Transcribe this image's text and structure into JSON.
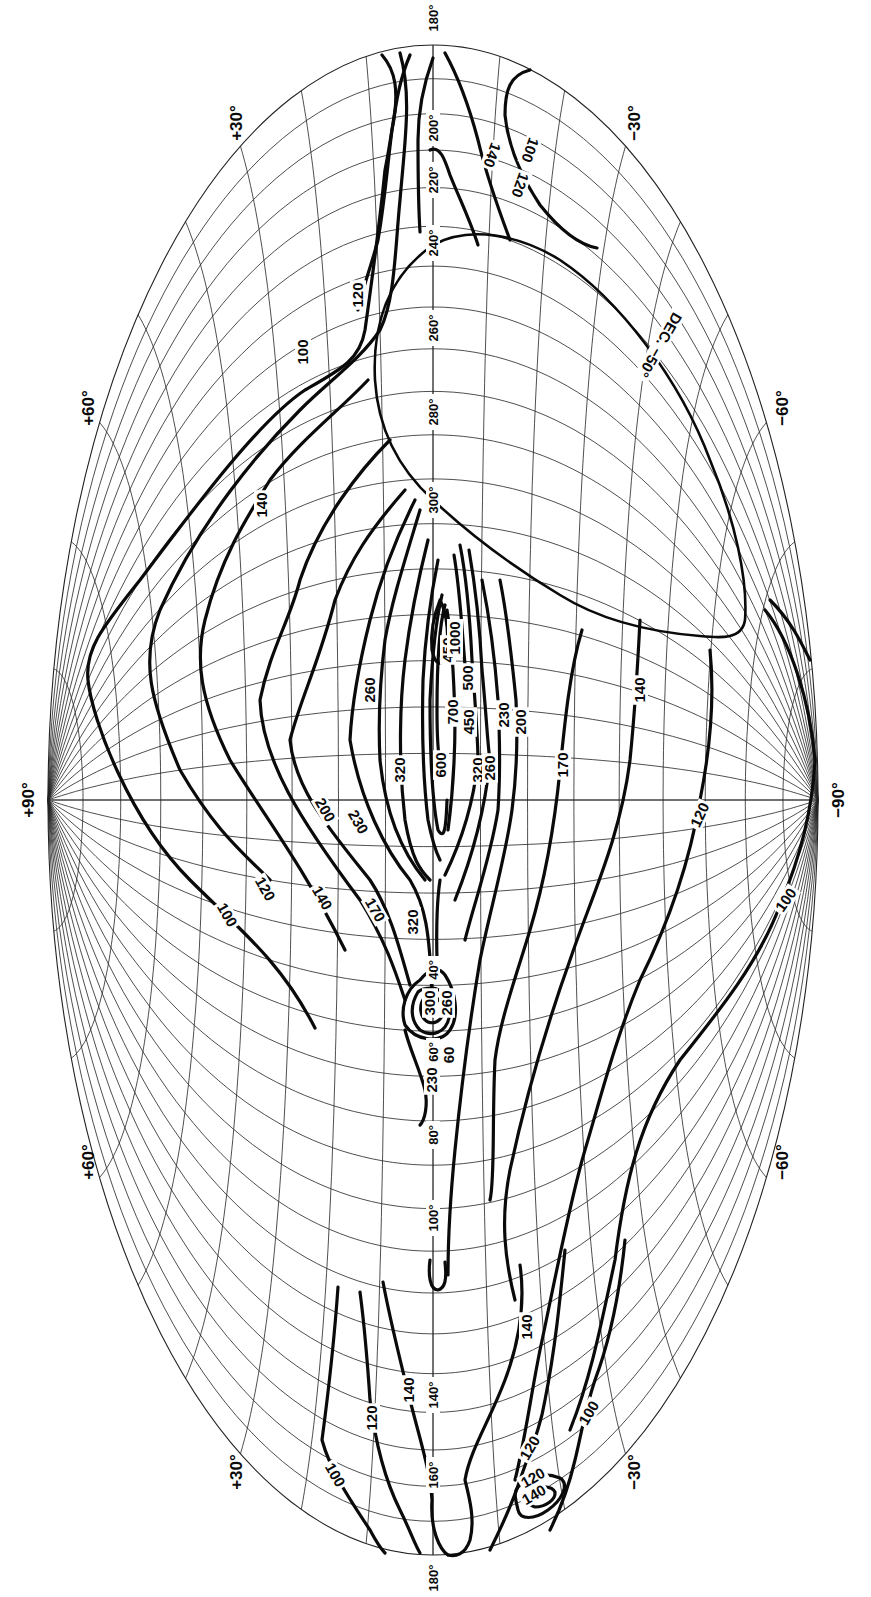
{
  "chart_data": {
    "type": "contour-map",
    "title": "",
    "projection": "Aitoff equal-area all-sky (galactic), rotated 90°",
    "orientation": {
      "latitude_axis": "horizontal (+90° left, −90° right)",
      "longitude_axis": "vertical (180° top and bottom, 0° center)"
    },
    "geometry": {
      "cx": 433,
      "cy": 800,
      "rx": 385,
      "ry": 755
    },
    "latitude_labels": [
      {
        "text": "+90°",
        "x": 28,
        "y": 800
      },
      {
        "text": "+60°",
        "x": 88,
        "y": 408
      },
      {
        "text": "+60°",
        "x": 88,
        "y": 1162
      },
      {
        "text": "+30°",
        "x": 236,
        "y": 123
      },
      {
        "text": "+30°",
        "x": 236,
        "y": 1472
      },
      {
        "text": "−30°",
        "x": 634,
        "y": 123
      },
      {
        "text": "−30°",
        "x": 634,
        "y": 1472
      },
      {
        "text": "−60°",
        "x": 782,
        "y": 408
      },
      {
        "text": "−60°",
        "x": 782,
        "y": 1162
      },
      {
        "text": "−90°",
        "x": 838,
        "y": 800
      }
    ],
    "longitude_labels": [
      {
        "text": "180°",
        "y": 18
      },
      {
        "text": "200°",
        "y": 128
      },
      {
        "text": "220°",
        "y": 180
      },
      {
        "text": "240°",
        "y": 243
      },
      {
        "text": "260°",
        "y": 328
      },
      {
        "text": "280°",
        "y": 412
      },
      {
        "text": "300°",
        "y": 500
      },
      {
        "text": "40°",
        "y": 970
      },
      {
        "text": "60°",
        "y": 1052
      },
      {
        "text": "80°",
        "y": 1135
      },
      {
        "text": "100°",
        "y": 1218
      },
      {
        "text": "140°",
        "y": 1395
      },
      {
        "text": "160°",
        "y": 1475
      },
      {
        "text": "180°",
        "y": 1578
      }
    ],
    "declination_boundary_label": "DEC. −50°",
    "contour_levels": [
      100,
      120,
      140,
      170,
      200,
      230,
      260,
      320,
      450,
      500,
      600,
      700,
      1000
    ],
    "contour_labels": [
      {
        "text": "100",
        "x": 303,
        "y": 352,
        "rot": -90
      },
      {
        "text": "120",
        "x": 358,
        "y": 295,
        "rot": -90
      },
      {
        "text": "140",
        "x": 262,
        "y": 505,
        "rot": -90
      },
      {
        "text": "140",
        "x": 492,
        "y": 155,
        "rot": 110
      },
      {
        "text": "120",
        "x": 520,
        "y": 185,
        "rot": 110
      },
      {
        "text": "100",
        "x": 530,
        "y": 150,
        "rot": 110
      },
      {
        "text": "DEC. −50°",
        "x": 660,
        "y": 345,
        "rot": 120
      },
      {
        "text": "260",
        "x": 370,
        "y": 690,
        "rot": -90
      },
      {
        "text": "320",
        "x": 400,
        "y": 770,
        "rot": -90
      },
      {
        "text": "320",
        "x": 413,
        "y": 922,
        "rot": -90
      },
      {
        "text": "600",
        "x": 441,
        "y": 765,
        "rot": -90
      },
      {
        "text": "700",
        "x": 453,
        "y": 712,
        "rot": -90
      },
      {
        "text": "450",
        "x": 448,
        "y": 650,
        "rot": -90
      },
      {
        "text": "1000",
        "x": 455,
        "y": 638,
        "rot": -90
      },
      {
        "text": "500",
        "x": 468,
        "y": 678,
        "rot": -90
      },
      {
        "text": "450",
        "x": 469,
        "y": 722,
        "rot": -90
      },
      {
        "text": "320",
        "x": 478,
        "y": 770,
        "rot": -90
      },
      {
        "text": "260",
        "x": 490,
        "y": 768,
        "rot": -90
      },
      {
        "text": "230",
        "x": 504,
        "y": 715,
        "rot": -90
      },
      {
        "text": "200",
        "x": 521,
        "y": 722,
        "rot": -90
      },
      {
        "text": "170",
        "x": 563,
        "y": 765,
        "rot": -90
      },
      {
        "text": "140",
        "x": 640,
        "y": 690,
        "rot": -90
      },
      {
        "text": "120",
        "x": 700,
        "y": 815,
        "rot": -65
      },
      {
        "text": "100",
        "x": 786,
        "y": 900,
        "rot": -55
      },
      {
        "text": "200",
        "x": 325,
        "y": 810,
        "rot": 60
      },
      {
        "text": "230",
        "x": 358,
        "y": 822,
        "rot": 60
      },
      {
        "text": "170",
        "x": 375,
        "y": 910,
        "rot": 60
      },
      {
        "text": "140",
        "x": 322,
        "y": 898,
        "rot": 60
      },
      {
        "text": "120",
        "x": 265,
        "y": 889,
        "rot": 60
      },
      {
        "text": "100",
        "x": 227,
        "y": 915,
        "rot": 60
      },
      {
        "text": "300",
        "x": 430,
        "y": 1003,
        "rot": -90
      },
      {
        "text": "260",
        "x": 447,
        "y": 1003,
        "rot": -90
      },
      {
        "text": "60",
        "x": 449,
        "y": 1055,
        "rot": -90
      },
      {
        "text": "230",
        "x": 432,
        "y": 1080,
        "rot": -90
      },
      {
        "text": "140",
        "x": 527,
        "y": 1327,
        "rot": -90
      },
      {
        "text": "140",
        "x": 409,
        "y": 1390,
        "rot": -90
      },
      {
        "text": "120",
        "x": 372,
        "y": 1418,
        "rot": -90
      },
      {
        "text": "100",
        "x": 335,
        "y": 1475,
        "rot": 60
      },
      {
        "text": "120",
        "x": 530,
        "y": 1448,
        "rot": -60
      },
      {
        "text": "100",
        "x": 589,
        "y": 1413,
        "rot": -60
      },
      {
        "text": "120",
        "x": 533,
        "y": 1478,
        "rot": -30
      },
      {
        "text": "140",
        "x": 534,
        "y": 1495,
        "rot": -30
      }
    ]
  },
  "contours": [
    {
      "name": "contour-100-north-upper",
      "d": "M410 55 C395 90 395 120 385 170 C380 220 372 280 365 330 C360 360 340 370 305 390 C260 420 200 500 140 580 C100 630 85 650 88 680 C92 720 130 820 190 880 C240 930 280 960 315 1028"
    },
    {
      "name": "contour-120-north-upper",
      "d": "M400 53 C412 95 405 140 400 200 C395 250 395 300 380 330 C360 360 330 380 300 410 C260 450 200 520 160 610 C140 660 150 700 180 770 C215 830 240 850 270 880"
    },
    {
      "name": "contour-140-north",
      "d": "M368 380 C340 410 300 440 270 480 C245 520 220 560 205 620 C195 660 200 700 230 760 C260 810 300 860 345 950"
    },
    {
      "name": "contour-170-north",
      "d": "M390 440 C360 470 320 520 300 580 C290 620 270 650 260 700 C262 760 300 820 360 900 C385 940 395 970 405 1000"
    },
    {
      "name": "contour-200",
      "d": "M405 490 C370 530 350 560 335 600 C320 660 300 700 290 740 C295 790 330 830 370 880 C390 910 400 950 410 985"
    },
    {
      "name": "contour-230",
      "d": "M415 500 C395 540 380 580 370 620 C360 660 352 700 350 740 C360 800 385 850 410 880 C425 905 430 930 432 1000"
    },
    {
      "name": "contour-260-left",
      "d": "M420 510 C405 560 392 600 385 640 C380 680 378 720 380 760 C385 810 400 850 425 880"
    },
    {
      "name": "contour-320-left",
      "d": "M428 540 C418 580 410 620 405 660 C400 700 398 760 405 820 C412 860 420 870 430 880"
    },
    {
      "name": "contour-450-left",
      "d": "M438 560 C430 600 425 640 423 680 C422 720 422 770 428 820 C432 840 435 850 440 860"
    },
    {
      "name": "contour-600",
      "d": "M442 595 C436 620 432 660 430 700 C430 750 432 800 438 830 C444 840 446 830 447 800"
    },
    {
      "name": "contour-700",
      "d": "M445 605 C438 630 437 670 437 710 C437 750 440 770 444 775"
    },
    {
      "name": "contour-1000-core",
      "d": "M440 600 C434 615 430 630 432 650 C435 665 442 668 446 655 C449 640 448 615 440 600 Z"
    },
    {
      "name": "contour-450-right",
      "d": "M447 610 C452 640 454 680 455 720 C455 760 452 800 448 830"
    },
    {
      "name": "contour-500-right",
      "d": "M454 555 C460 590 462 630 465 665"
    },
    {
      "name": "contour-320-right",
      "d": "M460 545 C467 580 470 620 472 660 C475 700 478 740 478 760 C474 800 462 840 445 875"
    },
    {
      "name": "contour-260-right",
      "d": "M469 550 C476 590 480 630 482 670 C486 710 488 750 490 760 C486 800 475 850 455 900"
    },
    {
      "name": "contour-230-right",
      "d": "M482 580 C490 620 495 660 498 700 C500 740 500 780 498 810 C490 860 475 900 465 940"
    },
    {
      "name": "contour-200-right",
      "d": "M500 580 C508 620 512 660 516 700 C518 740 516 780 512 810 C505 860 490 910 480 960 C470 1020 462 1080 455 1150 C450 1200 448 1240 448 1275"
    },
    {
      "name": "contour-170",
      "d": "M582 630 C570 670 565 720 560 770 C555 820 545 880 530 930 C515 980 500 1020 495 1060 C492 1120 495 1180 490 1200"
    },
    {
      "name": "contour-140-south",
      "d": "M640 620 C638 660 636 700 630 760 C620 840 590 900 570 960 C545 1030 525 1100 510 1170 C500 1220 505 1260 515 1300"
    },
    {
      "name": "contour-120-south",
      "d": "M710 650 C715 700 710 750 700 800 C690 860 670 920 640 980 C615 1040 600 1100 585 1150 C570 1200 555 1280 540 1350 C530 1400 525 1440 515 1480"
    },
    {
      "name": "contour-100-south",
      "d": "M765 610 C790 640 810 700 815 760 C812 820 795 870 780 905 C760 960 720 1010 680 1060 C640 1120 625 1180 615 1260 C600 1330 590 1380 570 1430"
    },
    {
      "name": "contour-north-top-1",
      "d": "M382 55 C395 70 400 90 392 130 C388 160 385 200 378 240 C370 270 362 290 358 310"
    },
    {
      "name": "contour-north-top-2",
      "d": "M433 58 C425 80 418 110 418 140 C418 170 418 200 420 232"
    },
    {
      "name": "contour-140-top",
      "d": "M430 150 C440 145 445 160 450 175 C460 200 470 220 478 245"
    },
    {
      "name": "contour-120-top",
      "d": "M445 53 C460 80 470 110 478 140 C485 170 495 200 510 240"
    },
    {
      "name": "contour-100-top",
      "d": "M530 70 C510 75 505 90 505 115 C508 145 520 175 540 205 C560 230 580 245 597 248"
    },
    {
      "name": "contour-40-stem",
      "d": "M440 880 C437 900 436 920 437 960"
    },
    {
      "name": "contour-cas-outer",
      "d": "M420 980 C405 990 400 1010 405 1025 C415 1040 440 1045 450 1030 C460 1015 455 990 445 975 C438 965 428 970 420 980 Z"
    },
    {
      "name": "contour-cas-mid",
      "d": "M418 992 C410 1005 410 1020 420 1030 C432 1038 446 1032 449 1018 C450 1000 442 988 432 988 C425 988 420 990 418 992 Z"
    },
    {
      "name": "contour-cas-inner",
      "d": "M425 997 C418 1005 420 1018 428 1022 C437 1025 444 1018 443 1008 C441 998 432 994 425 997 Z"
    },
    {
      "name": "contour-230-lower-left",
      "d": "M405 1030 C410 1050 420 1070 425 1090 C428 1105 425 1120 420 1125"
    },
    {
      "name": "contour-60-stem",
      "d": "M433 1040 C433 1060 434 1070 434 1080"
    },
    {
      "name": "contour-lower-hook",
      "d": "M430 1260 C428 1275 430 1290 438 1290 C445 1288 447 1280 445 1262"
    },
    {
      "name": "contour-140-lower-north",
      "d": "M383 1282 C390 1320 400 1360 410 1400 C420 1440 430 1470 432 1500 C430 1530 440 1550 448 1555"
    },
    {
      "name": "contour-120-lower-north",
      "d": "M360 1292 C365 1330 368 1370 370 1400 C375 1440 385 1480 400 1510 C410 1530 415 1545 420 1553"
    },
    {
      "name": "contour-100-lower-north",
      "d": "M338 1287 C335 1330 330 1380 322 1440 C330 1470 350 1500 370 1530 C378 1545 382 1550 385 1553"
    },
    {
      "name": "contour-140-lower-south",
      "d": "M520 1265 C525 1300 520 1340 505 1380 C490 1420 470 1450 465 1480 C470 1500 475 1520 470 1540 C465 1555 455 1557 448 1555"
    },
    {
      "name": "contour-120-lower-south",
      "d": "M565 1250 C560 1300 555 1350 545 1400 C540 1430 530 1450 520 1480 C510 1510 500 1530 490 1550"
    },
    {
      "name": "contour-100-lower-south",
      "d": "M625 1240 C620 1290 610 1340 595 1380 C585 1410 580 1440 575 1460 C568 1490 560 1510 550 1530"
    },
    {
      "name": "contour-120-island",
      "d": "M520 1485 C528 1475 545 1472 560 1478 C570 1484 562 1500 548 1510 C534 1520 520 1520 518 1510 C516 1500 512 1492 520 1485 Z"
    },
    {
      "name": "contour-140-island",
      "d": "M530 1490 C540 1485 552 1486 555 1492 C556 1500 545 1507 535 1507 C527 1505 525 1495 530 1490 Z"
    },
    {
      "name": "contour-120-far-south-east",
      "d": "M770 600 C790 620 800 640 810 660"
    }
  ],
  "declination_boundary": {
    "name": "dec-minus-50-boundary",
    "d": "M433 500 C400 470 378 430 375 380 C372 320 390 275 433 245 C470 225 520 235 560 260 C620 300 680 380 710 460 C735 520 748 580 745 620 C742 640 720 638 700 636 C650 632 600 620 560 595 C510 565 465 530 433 500 Z"
  },
  "colors": {
    "background": "#ffffff",
    "ink": "#0a0a0a",
    "grid": "#222222"
  }
}
